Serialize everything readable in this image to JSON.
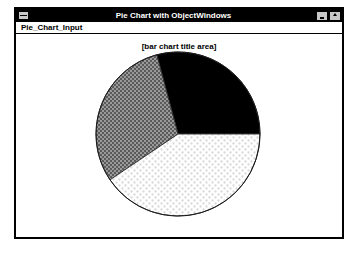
{
  "window": {
    "title": "Pie Chart with ObjectWindows",
    "sysmenu_icon": "system-menu-icon",
    "minimize_icon": "minimize-icon",
    "maximize_icon": "maximize-icon"
  },
  "menubar": {
    "items": [
      {
        "label": "Pie_Chart_Input"
      }
    ]
  },
  "chart_data": {
    "type": "pie",
    "title": "[bar chart title area]",
    "xlabel": "",
    "ylabel": "",
    "legend": "none",
    "grid": false,
    "center": {
      "x": 178,
      "y": 134
    },
    "radius": 82,
    "start_angle_deg": 0,
    "direction": "counterclockwise",
    "categories": [
      "Slice 1",
      "Slice 2",
      "Slice 3"
    ],
    "values": [
      29,
      30,
      41
    ],
    "slices": [
      {
        "name": "Slice 1",
        "value": 29,
        "percent": 29,
        "start_angle_deg": 0,
        "end_angle_deg": 105,
        "fill_style": "solid-black",
        "color": "#000000"
      },
      {
        "name": "Slice 2",
        "value": 30,
        "percent": 30,
        "start_angle_deg": 105,
        "end_angle_deg": 214,
        "fill_style": "checkerboard-50-gray",
        "color": "#808080"
      },
      {
        "name": "Slice 3",
        "value": 41,
        "percent": 41,
        "start_angle_deg": 214,
        "end_angle_deg": 360,
        "fill_style": "sparse-dot-dither",
        "color": "#ffffff"
      }
    ]
  }
}
